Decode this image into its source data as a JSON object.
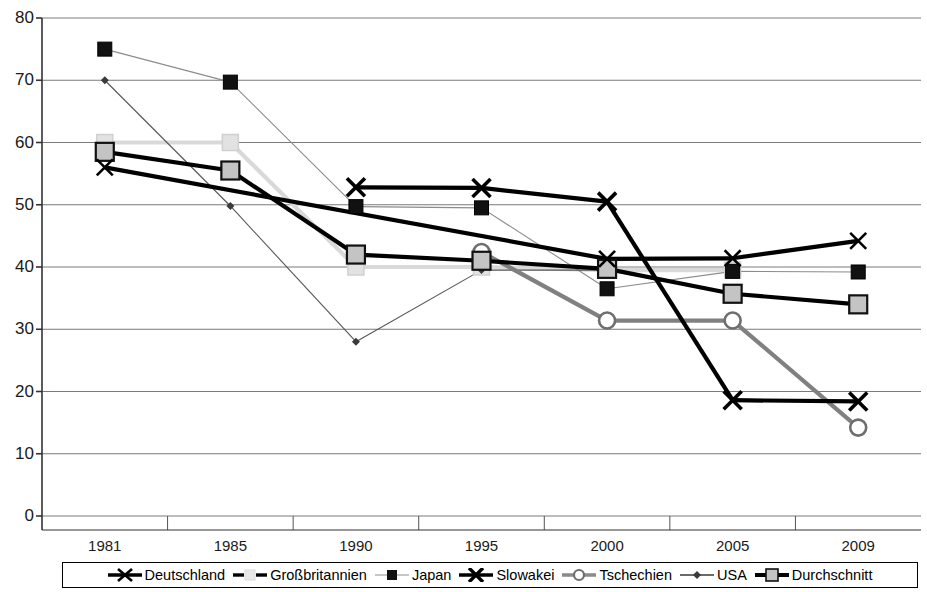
{
  "chart_data": {
    "type": "line",
    "title": "",
    "subtitle": "",
    "xlabel": "",
    "ylabel": "",
    "categories": [
      "1981",
      "1985",
      "1990",
      "1995",
      "2000",
      "2005",
      "2009"
    ],
    "ylim": [
      0,
      80
    ],
    "y_ticks": [
      0,
      10,
      20,
      30,
      40,
      50,
      60,
      70,
      80
    ],
    "grid": "horizontal",
    "legend_position": "bottom",
    "series": [
      {
        "name": "Deutschland",
        "color": "#000000",
        "marker": "x",
        "line": "thick-solid",
        "values": [
          56.0,
          null,
          null,
          null,
          41.3,
          41.4,
          44.2
        ]
      },
      {
        "name": "Großbritannien",
        "color": "#d9d9d9",
        "marker": "square",
        "line": "thick-light",
        "values": [
          60.0,
          60.0,
          40.0,
          40.0,
          39.5,
          39.5,
          null
        ]
      },
      {
        "name": "Japan",
        "color": "#8c8c8c",
        "marker": "square-black",
        "line": "thin-gray",
        "values": [
          75.0,
          69.7,
          49.7,
          49.5,
          36.5,
          39.3,
          39.2
        ]
      },
      {
        "name": "Slowakei",
        "color": "#000000",
        "marker": "x-bold",
        "line": "thick-solid",
        "values": [
          null,
          null,
          52.8,
          52.7,
          50.5,
          18.6,
          18.4
        ]
      },
      {
        "name": "Tschechien",
        "color": "#808080",
        "marker": "circle",
        "line": "thick-gray",
        "values": [
          null,
          null,
          null,
          42.4,
          31.4,
          31.4,
          14.2
        ]
      },
      {
        "name": "USA",
        "color": "#555555",
        "marker": "diamond",
        "line": "thin-solid",
        "values": [
          70.0,
          49.8,
          28.0,
          39.5,
          39.5,
          35.6,
          34.0
        ]
      },
      {
        "name": "Durchschnitt",
        "color": "#000000",
        "marker": "square-gray",
        "line": "thick-solid",
        "values": [
          58.5,
          55.5,
          42.0,
          41.0,
          39.7,
          35.7,
          34.0
        ]
      }
    ]
  },
  "axes": {
    "y_labels": [
      "80",
      "70",
      "60",
      "50",
      "40",
      "30",
      "20",
      "10",
      "0"
    ],
    "x_labels": [
      "1981",
      "1985",
      "1990",
      "1995",
      "2000",
      "2005",
      "2009"
    ]
  },
  "legend": {
    "items": [
      {
        "label": "Deutschland",
        "key": "line-x-marker-icon"
      },
      {
        "label": "Großbritannien",
        "key": "line-light-square-icon"
      },
      {
        "label": "Japan",
        "key": "line-black-square-icon"
      },
      {
        "label": "Slowakei",
        "key": "line-bold-x-icon"
      },
      {
        "label": "Tschechien",
        "key": "line-circle-icon"
      },
      {
        "label": "USA",
        "key": "line-thin-icon"
      },
      {
        "label": "Durchschnitt",
        "key": "line-gray-square-icon"
      }
    ]
  }
}
